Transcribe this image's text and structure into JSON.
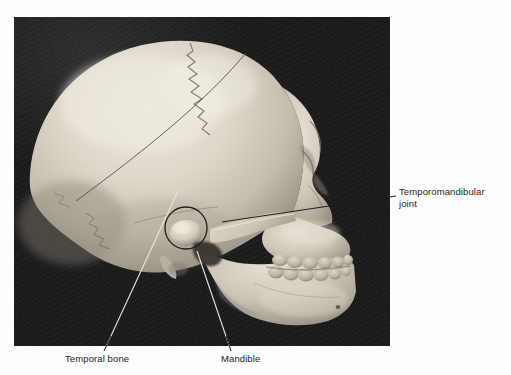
{
  "figure": {
    "kind": "anatomical-photograph",
    "background_color": "#ffffff",
    "photo_background_color": "#1a1a1a",
    "bone_color": "#d8d2c6",
    "leader_line_color": "#2a2a2a"
  },
  "photo": {
    "alt": "Grayscale photograph of a human skull seen from the left side on a black background",
    "left": 14,
    "top": 17,
    "width": 376,
    "height": 329
  },
  "labels": {
    "tmj": {
      "text": "Temporomandibular\njoint",
      "line1": "Temporomandibular",
      "line2": "joint"
    },
    "temporal_bone": {
      "text": "Temporal bone"
    },
    "mandible": {
      "text": "Mandible"
    }
  },
  "annotations": {
    "tmj_circle": {
      "cx": 186,
      "cy": 228,
      "r": 21
    },
    "leaders": [
      {
        "name": "tmj-leader",
        "x1": 222,
        "y1": 222,
        "x2": 396,
        "y2": 196
      },
      {
        "name": "temporal-bone-leader",
        "x1": 178,
        "y1": 191,
        "x2": 104,
        "y2": 351
      },
      {
        "name": "mandible-leader",
        "x1": 197,
        "y1": 251,
        "x2": 231,
        "y2": 351
      }
    ]
  }
}
